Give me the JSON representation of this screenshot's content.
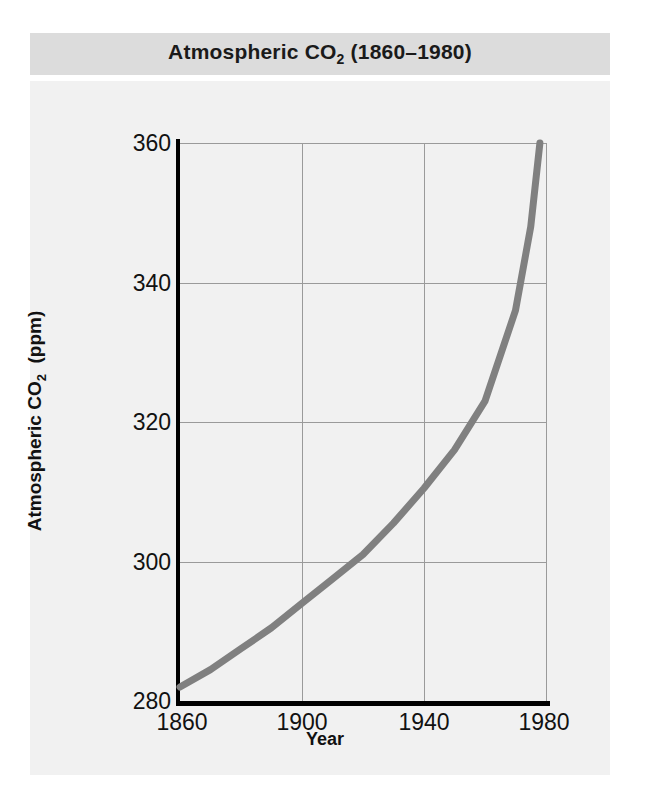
{
  "figure": {
    "title_main": "Atmospheric CO",
    "title_sub": "2",
    "title_suffix": " (1860–1980)",
    "banner_color": "#dcdcdc",
    "panel_color": "#f1f1f1",
    "curve_color": "#808080",
    "axis_color": "#000000",
    "grid_color": "#9a9a9a"
  },
  "axes": {
    "ylabel_main": "Atmospheric CO",
    "ylabel_sub": "2",
    "ylabel_suffix": "  (ppm)",
    "xlabel": "Year",
    "xticks": [
      "1860",
      "1900",
      "1940",
      "1980"
    ],
    "yticks": [
      "280",
      "300",
      "320",
      "340",
      "360"
    ]
  },
  "chart_data": {
    "type": "line",
    "title": "Atmospheric CO2 (1860–1980)",
    "xlabel": "Year",
    "ylabel": "Atmospheric CO2 (ppm)",
    "xlim": [
      1860,
      1980
    ],
    "ylim": [
      280,
      360
    ],
    "xticks": [
      1860,
      1900,
      1940,
      1980
    ],
    "yticks": [
      280,
      300,
      320,
      340,
      360
    ],
    "grid": true,
    "legend": "none",
    "series": [
      {
        "name": "Atmospheric CO2",
        "color": "#808080",
        "x": [
          1860,
          1870,
          1880,
          1890,
          1900,
          1910,
          1920,
          1930,
          1940,
          1950,
          1960,
          1970,
          1975,
          1978
        ],
        "values": [
          282,
          284.5,
          287.5,
          290.5,
          294,
          297.5,
          301,
          305.5,
          310.5,
          316,
          323,
          336,
          348,
          360
        ]
      }
    ]
  }
}
